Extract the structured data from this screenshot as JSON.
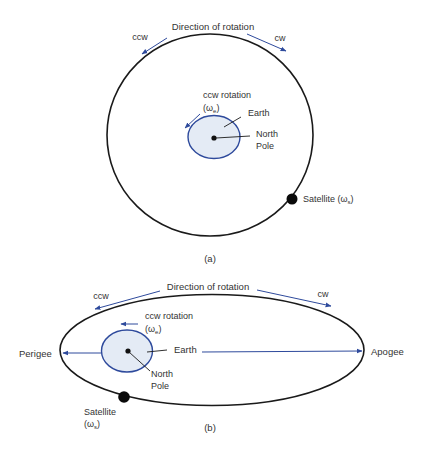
{
  "colors": {
    "orbit": "#1a1a1a",
    "earth_fill": "#e4ebf5",
    "earth_stroke": "#2e4a9c",
    "arrow": "#2e4a9c",
    "text": "#333333"
  },
  "panel_a": {
    "direction_label": "Direction of rotation",
    "ccw_label": "ccw",
    "cw_label": "cw",
    "earth_rotation_label": "ccw rotation",
    "earth_omega_prefix": "(ω",
    "earth_omega_sub": "e",
    "earth_omega_suffix": ")",
    "earth_label": "Earth",
    "north_label": "North",
    "pole_label": "Pole",
    "satellite_label": "Satellite (ω",
    "satellite_sub": "s",
    "satellite_suffix": ")",
    "caption": "(a)"
  },
  "panel_b": {
    "direction_label": "Direction of rotation",
    "ccw_label": "ccw",
    "cw_label": "cw",
    "earth_rotation_label": "ccw rotation",
    "earth_omega_prefix": "(ω",
    "earth_omega_sub": "e",
    "earth_omega_suffix": ")",
    "earth_label": "Earth",
    "north_label": "North",
    "pole_label": "Pole",
    "perigee_label": "Perigee",
    "apogee_label": "Apogee",
    "satellite_label": "Satellite",
    "satellite_omega_prefix": "(ω",
    "satellite_sub": "s",
    "satellite_suffix": ")",
    "caption": "(b)"
  }
}
